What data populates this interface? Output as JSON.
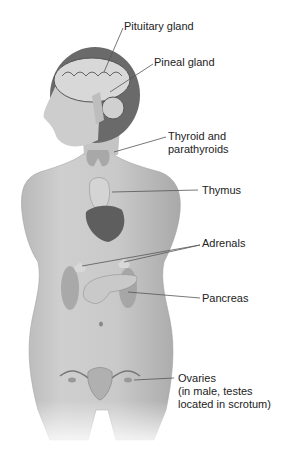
{
  "figure": {
    "labels": [
      {
        "id": "pituitary",
        "text": "Pituitary gland"
      },
      {
        "id": "pineal",
        "text": "Pineal gland"
      },
      {
        "id": "thyroid_line1",
        "text": "Thyroid and"
      },
      {
        "id": "thyroid_line2",
        "text": "parathyroids"
      },
      {
        "id": "thymus",
        "text": "Thymus"
      },
      {
        "id": "adrenals",
        "text": "Adrenals"
      },
      {
        "id": "pancreas",
        "text": "Pancreas"
      },
      {
        "id": "ovaries_line1",
        "text": "Ovaries"
      },
      {
        "id": "ovaries_line2",
        "text": "(in male, testes"
      },
      {
        "id": "ovaries_line3",
        "text": "located in scrotum)"
      }
    ]
  }
}
